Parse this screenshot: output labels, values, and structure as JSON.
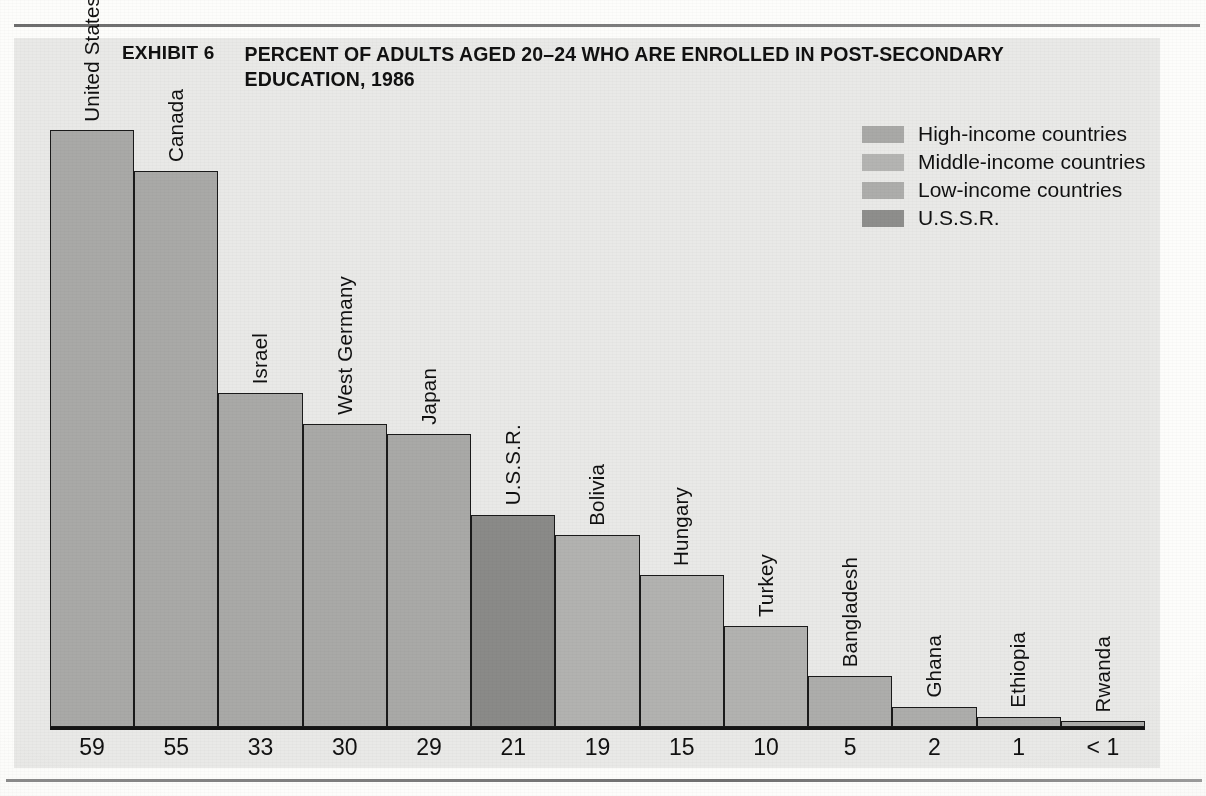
{
  "header": {
    "exhibit_label": "EXHIBIT 6",
    "title": "PERCENT OF ADULTS AGED 20–24 WHO ARE ENROLLED IN POST-SECONDARY EDUCATION, 1986"
  },
  "legend": {
    "items": [
      {
        "label": "High-income countries",
        "color": "#a9a9a7"
      },
      {
        "label": "Middle-income countries",
        "color": "#b4b4b2"
      },
      {
        "label": "Low-income countries",
        "color": "#adadab"
      },
      {
        "label": "U.S.S.R.",
        "color": "#8e8e8c"
      }
    ]
  },
  "chart_data": {
    "type": "bar",
    "title": "PERCENT OF ADULTS AGED 20–24 WHO ARE ENROLLED IN POST-SECONDARY EDUCATION, 1986",
    "xlabel": "",
    "ylabel": "",
    "ylim": [
      0,
      62
    ],
    "grid": false,
    "legend_position": "top-right",
    "orientation": "vertical",
    "categories": [
      "United States",
      "Canada",
      "Israel",
      "West Germany",
      "Japan",
      "U.S.S.R.",
      "Bolivia",
      "Hungary",
      "Turkey",
      "Bangladesh",
      "Ghana",
      "Ethiopia",
      "Rwanda"
    ],
    "values": [
      59,
      55,
      33,
      30,
      29,
      21,
      19,
      15,
      10,
      5,
      2,
      1,
      0.4
    ],
    "value_labels": [
      "59",
      "55",
      "33",
      "30",
      "29",
      "21",
      "19",
      "15",
      "10",
      "5",
      "2",
      "1",
      "< 1"
    ],
    "groups": [
      "High-income countries",
      "High-income countries",
      "High-income countries",
      "High-income countries",
      "High-income countries",
      "U.S.S.R.",
      "Middle-income countries",
      "Middle-income countries",
      "Middle-income countries",
      "Low-income countries",
      "Low-income countries",
      "Low-income countries",
      "Low-income countries"
    ],
    "bar_colors": [
      "#a9a9a7",
      "#a9a9a7",
      "#a9a9a7",
      "#a9a9a7",
      "#a9a9a7",
      "#8a8a88",
      "#b2b2b0",
      "#b2b2b0",
      "#b2b2b0",
      "#adadab",
      "#adadab",
      "#adadab",
      "#adadab"
    ]
  }
}
